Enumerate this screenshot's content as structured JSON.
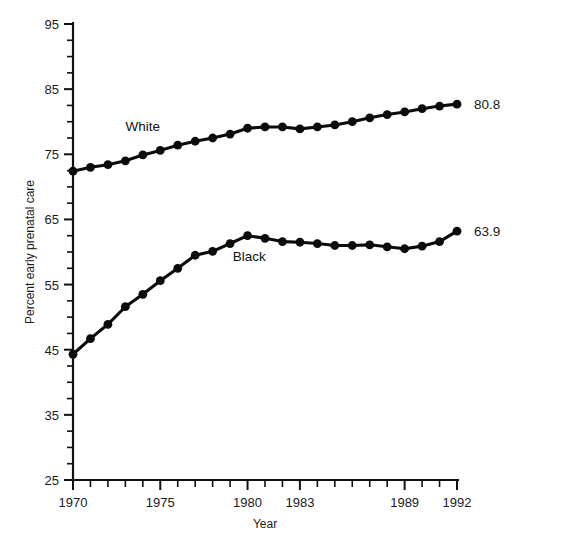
{
  "chart_data": {
    "type": "line",
    "title": "",
    "xlabel": "Year",
    "ylabel": "Percent early prenatal care",
    "xlim": [
      1970,
      1992
    ],
    "ylim": [
      25,
      95
    ],
    "grid": false,
    "legend_position": "inline-annotations",
    "y_ticks_major": [
      25,
      35,
      45,
      55,
      65,
      75,
      85,
      95
    ],
    "y_tick_labels": [
      "25",
      "35",
      "45",
      "55",
      "65",
      "75",
      "85",
      "95"
    ],
    "y_minor_step": 2.5,
    "x_ticks_major": [
      1970,
      1975,
      1980,
      1983,
      1989,
      1992
    ],
    "x_tick_labels": [
      "1970",
      "1975",
      "1980",
      "1983",
      "1989",
      "1992"
    ],
    "x_minor_step": 1,
    "x": [
      1970,
      1971,
      1972,
      1973,
      1974,
      1975,
      1976,
      1977,
      1978,
      1979,
      1980,
      1981,
      1982,
      1983,
      1984,
      1985,
      1986,
      1987,
      1988,
      1989,
      1990,
      1991,
      1992
    ],
    "series": [
      {
        "name": "White",
        "label": "White",
        "color": "#0b0b0b",
        "end_label": "80.8",
        "values": [
          72.4,
          73.0,
          73.4,
          74.0,
          74.9,
          75.6,
          76.4,
          77.0,
          77.5,
          78.1,
          79.0,
          79.2,
          79.2,
          78.9,
          79.2,
          79.5,
          80.0,
          80.6,
          81.1,
          81.5,
          82.0,
          82.4,
          82.7
        ]
      },
      {
        "name": "Black",
        "label": "Black",
        "color": "#0b0b0b",
        "end_label": "63.9",
        "values": [
          44.3,
          46.7,
          48.9,
          51.6,
          53.5,
          55.6,
          57.5,
          59.5,
          60.1,
          61.3,
          62.5,
          62.1,
          61.6,
          61.5,
          61.3,
          61.0,
          61.0,
          61.1,
          60.8,
          60.5,
          60.9,
          61.6,
          63.2
        ]
      }
    ],
    "annotations": [
      {
        "text": "White",
        "x": 1974.0,
        "y": 78.6
      },
      {
        "text": "Black",
        "x": 1980.1,
        "y": 58.6
      }
    ],
    "end_labels": [
      {
        "text": "80.8",
        "series": "White"
      },
      {
        "text": "63.9",
        "series": "Black"
      }
    ]
  }
}
